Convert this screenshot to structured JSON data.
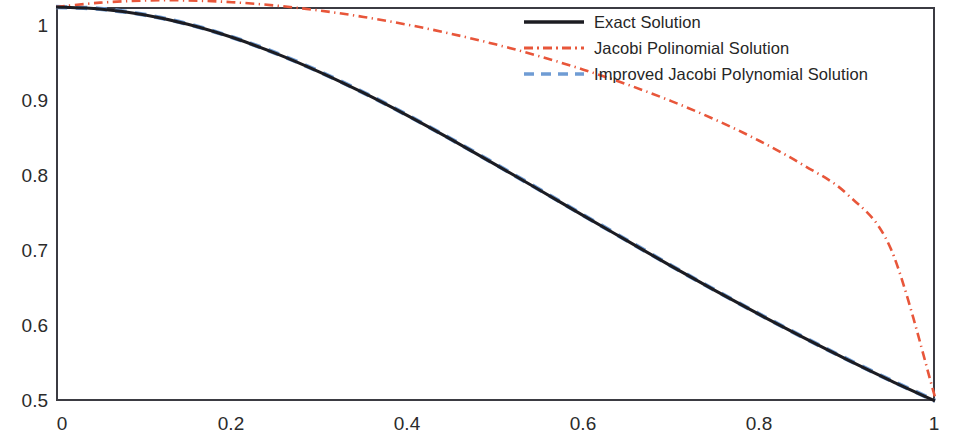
{
  "chart_data": {
    "type": "line",
    "title": "",
    "xlabel": "",
    "ylabel": "",
    "xlim": [
      0,
      1
    ],
    "ylim": [
      0.5,
      1
    ],
    "grid": false,
    "legend_position": "top-right",
    "x_ticks": [
      "0",
      "0.2",
      "0.4",
      "0.6",
      "0.8",
      "1"
    ],
    "x_tick_values": [
      0,
      0.2,
      0.4,
      0.6,
      0.8,
      1
    ],
    "y_ticks": [
      "0.5",
      "0.6",
      "0.7",
      "0.8",
      "0.9",
      "1"
    ],
    "y_tick_values": [
      0.5,
      0.6,
      0.7,
      0.8,
      0.9,
      1
    ],
    "x": [
      0,
      0.05,
      0.1,
      0.15,
      0.2,
      0.25,
      0.3,
      0.35,
      0.4,
      0.45,
      0.5,
      0.55,
      0.6,
      0.65,
      0.7,
      0.75,
      0.8,
      0.85,
      0.9,
      0.95,
      1
    ],
    "series": [
      {
        "name": "Exact Solution",
        "color": "#1c1c22",
        "style": "solid",
        "width": 3.1,
        "values": [
          1,
          0.9975,
          0.9901,
          0.978,
          0.9615,
          0.9412,
          0.9174,
          0.8909,
          0.8621,
          0.8316,
          0.8,
          0.7678,
          0.7353,
          0.7032,
          0.6711,
          0.64,
          0.6098,
          0.5806,
          0.5525,
          0.5256,
          0.5
        ]
      },
      {
        "name": "Jacobi Polinomial Solution",
        "color": "#e8563a",
        "style": "dashdot",
        "width": 2.6,
        "values": [
          1.0,
          1.0055,
          1.0082,
          1.0083,
          1.0061,
          1.0018,
          0.9955,
          0.9874,
          0.9775,
          0.9659,
          0.9526,
          0.9375,
          0.9205,
          0.9016,
          0.8806,
          0.857,
          0.8303,
          0.7995,
          0.7625,
          0.6925,
          0.505
        ]
      },
      {
        "name": "Improved Jacobi Polynomial Solution",
        "color": "#6f9cd4",
        "style": "dashed",
        "width": 4.4,
        "values": [
          1,
          0.9976,
          0.9903,
          0.9783,
          0.9618,
          0.9415,
          0.9178,
          0.8913,
          0.8625,
          0.832,
          0.8004,
          0.7682,
          0.7357,
          0.7036,
          0.6715,
          0.6404,
          0.6102,
          0.581,
          0.5529,
          0.526,
          0.5004
        ]
      }
    ]
  },
  "legend": {
    "items": [
      {
        "label": "Exact Solution",
        "swatch": "solid-line-swatch"
      },
      {
        "label": "Jacobi Polinomial Solution",
        "swatch": "dashdot-line-swatch"
      },
      {
        "label": "Improved Jacobi Polynomial Solution",
        "swatch": "dashed-line-swatch"
      }
    ]
  },
  "axes": {
    "frame_color": "#3b3b42",
    "tick_text_color": "#2b2b2b"
  }
}
